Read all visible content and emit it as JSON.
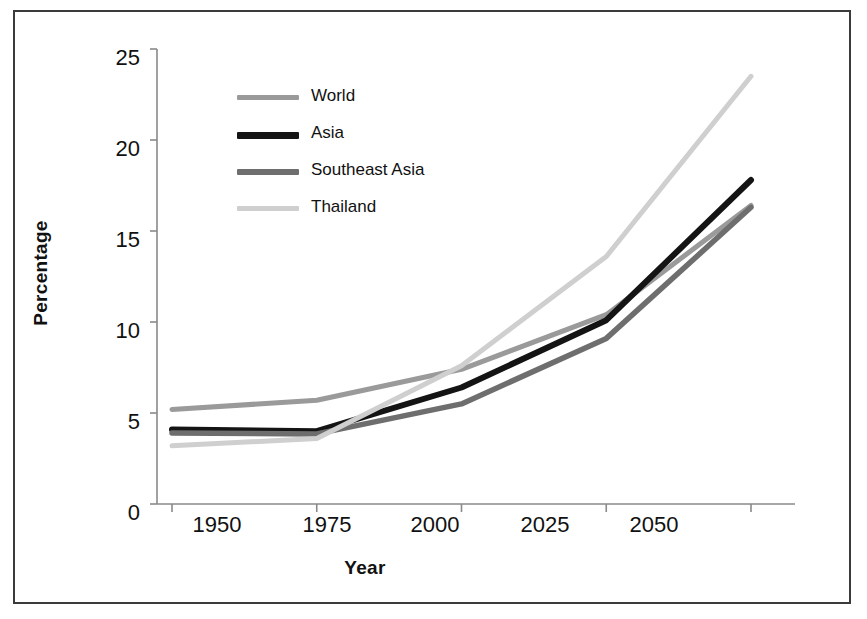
{
  "chart_data": {
    "type": "line",
    "title": "",
    "xlabel": "Year",
    "ylabel": "Percentage",
    "categories": [
      "1950",
      "1975",
      "2000",
      "2025",
      "2050"
    ],
    "x": [
      1950,
      1975,
      2000,
      2025,
      2050
    ],
    "xlim": [
      1950,
      2050
    ],
    "ylim": [
      0,
      25
    ],
    "y_ticks": [
      "0",
      "5",
      "10",
      "15",
      "20",
      "25"
    ],
    "y_tick_values": [
      0,
      5,
      10,
      15,
      20,
      25
    ],
    "grid": false,
    "legend_position": "upper-left-inside",
    "series": [
      {
        "name": "World",
        "color": "#9a9a9a",
        "values": [
          5.2,
          5.7,
          7.4,
          10.4,
          16.4
        ]
      },
      {
        "name": "Asia",
        "color": "#141414",
        "values": [
          4.1,
          4.0,
          6.4,
          10.1,
          17.8
        ]
      },
      {
        "name": "Southeast Asia",
        "color": "#6e6e6e",
        "values": [
          3.9,
          3.85,
          5.5,
          9.1,
          16.3
        ]
      },
      {
        "name": "Thailand",
        "color": "#cfcfcf",
        "values": [
          3.2,
          3.6,
          7.6,
          13.6,
          23.5
        ]
      }
    ]
  },
  "legend": {
    "items": [
      {
        "label": "World",
        "color": "#9a9a9a"
      },
      {
        "label": "Asia",
        "color": "#141414"
      },
      {
        "label": "Southeast Asia",
        "color": "#6e6e6e"
      },
      {
        "label": "Thailand",
        "color": "#cfcfcf"
      }
    ]
  },
  "axes": {
    "y_title": "Percentage",
    "x_title": "Year",
    "y_ticks": [
      "25",
      "20",
      "15",
      "10",
      "5",
      "0"
    ],
    "x_ticks": [
      "1950",
      "1975",
      "2000",
      "2025",
      "2050"
    ]
  },
  "colors": {
    "frame": "#3a3a3a",
    "axis": "#8a8a8a",
    "text": "#111111",
    "background": "#ffffff"
  }
}
